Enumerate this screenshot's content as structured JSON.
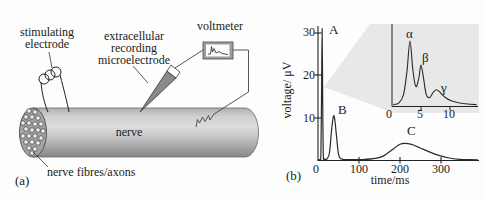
{
  "figure": {
    "panel_a": {
      "tag": "(a)",
      "labels": {
        "stimulating_line1": "stimulating",
        "stimulating_line2": "electrode",
        "recording_line1": "extracellular",
        "recording_line2": "recording",
        "recording_line3": "microelectrode",
        "voltmeter": "voltmeter",
        "nerve": "nerve",
        "fibres": "nerve fibres/axons"
      }
    },
    "panel_b": {
      "tag": "(b)",
      "x_axis_label": "time/ms",
      "y_axis_label": "voltage/ μV",
      "y_tick_labels": [
        "30",
        "20",
        "10"
      ],
      "x_tick_labels": [
        "0",
        "100",
        "200",
        "300"
      ],
      "peak_labels": {
        "a": "A",
        "b": "B",
        "c": "C"
      },
      "inset": {
        "x_tick_labels": [
          "0",
          "5",
          "10"
        ],
        "peak_labels": {
          "alpha": "α",
          "beta": "β",
          "gamma": "γ"
        }
      }
    }
  },
  "chart_data": {
    "type": "line",
    "xlabel": "time/ms",
    "ylabel": "voltage/ μV",
    "xlim": [
      0,
      390
    ],
    "ylim": [
      0,
      32
    ],
    "x_ticks": [
      0,
      100,
      200,
      300
    ],
    "y_ticks": [
      10,
      20,
      30
    ],
    "grid": false,
    "series": [
      {
        "name": "compound action potential",
        "peaks": {
          "A": {
            "t_ms": 10,
            "uV": 31
          },
          "B": {
            "t_ms": 39,
            "uV": 10.6
          },
          "C": {
            "t_ms": 212,
            "uV": 4.1
          }
        },
        "points_t_uV": [
          [
            0,
            0.3
          ],
          [
            5,
            0.4
          ],
          [
            7,
            1.5
          ],
          [
            8.5,
            14
          ],
          [
            10,
            31
          ],
          [
            11.5,
            14
          ],
          [
            13,
            1.5
          ],
          [
            16,
            0.5
          ],
          [
            22,
            0.5
          ],
          [
            28,
            2
          ],
          [
            34,
            8
          ],
          [
            39,
            10.6
          ],
          [
            44,
            7
          ],
          [
            49,
            2.2
          ],
          [
            53,
            0.8
          ],
          [
            60,
            0.4
          ],
          [
            80,
            0.35
          ],
          [
            110,
            0.35
          ],
          [
            140,
            0.6
          ],
          [
            160,
            1.2
          ],
          [
            180,
            2.6
          ],
          [
            200,
            3.9
          ],
          [
            212,
            4.15
          ],
          [
            228,
            3.9
          ],
          [
            248,
            3.1
          ],
          [
            270,
            2.2
          ],
          [
            295,
            1.3
          ],
          [
            320,
            0.7
          ],
          [
            345,
            0.4
          ],
          [
            370,
            0.3
          ],
          [
            390,
            0.28
          ]
        ]
      }
    ],
    "inset": {
      "description": "expanded view of peak A",
      "x_ticks": [
        0,
        5,
        10
      ],
      "xlim": [
        0,
        15
      ],
      "peaks": {
        "alpha": {
          "t_ms": 3.1,
          "rel_height": 1.0
        },
        "beta": {
          "t_ms": 5.0,
          "rel_height": 0.63
        },
        "gamma": {
          "t_ms": 7.7,
          "rel_height": 0.25
        }
      },
      "points_t_relheight": [
        [
          0.2,
          0.02
        ],
        [
          1.2,
          0.05
        ],
        [
          2.0,
          0.18
        ],
        [
          2.6,
          0.55
        ],
        [
          3.1,
          1.0
        ],
        [
          3.6,
          0.55
        ],
        [
          4.1,
          0.3
        ],
        [
          4.6,
          0.42
        ],
        [
          5.0,
          0.63
        ],
        [
          5.45,
          0.42
        ],
        [
          5.9,
          0.18
        ],
        [
          6.5,
          0.13
        ],
        [
          7.1,
          0.21
        ],
        [
          7.7,
          0.25
        ],
        [
          8.4,
          0.2
        ],
        [
          9.2,
          0.13
        ],
        [
          10.2,
          0.08
        ],
        [
          11.5,
          0.05
        ],
        [
          13.0,
          0.03
        ],
        [
          14.6,
          0.02
        ]
      ]
    },
    "colors": {
      "curve": "#2a2a2a",
      "zoom_wedge": "#e8e8e8"
    }
  }
}
